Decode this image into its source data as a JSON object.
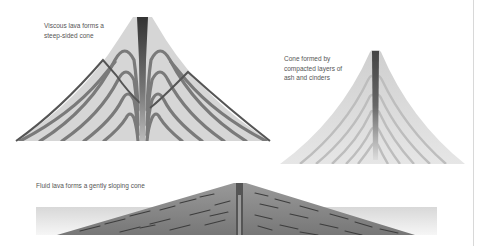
{
  "labels": {
    "viscous": "Viscous lava forms a\nsteep-sided cone",
    "cinder": "Cone formed by\ncompacted layers of\nash and cinders",
    "fluid": "Fluid lava forms a gently sloping cone"
  },
  "volcanoes": [
    {
      "id": "steep-sided-cone",
      "type": "lava dome / viscous lava"
    },
    {
      "id": "cinder-cone",
      "type": "ash and cinder cone"
    },
    {
      "id": "shield-volcano",
      "type": "fluid lava shield"
    }
  ],
  "colors": {
    "cone_fill": "#d6d6d6",
    "lava_layer": "#7a7a7a",
    "conduit": "#3a3a3a",
    "shield_fill": "#8a8a8a",
    "band": "#e6e6e6",
    "divider": "#d8d8d8"
  }
}
